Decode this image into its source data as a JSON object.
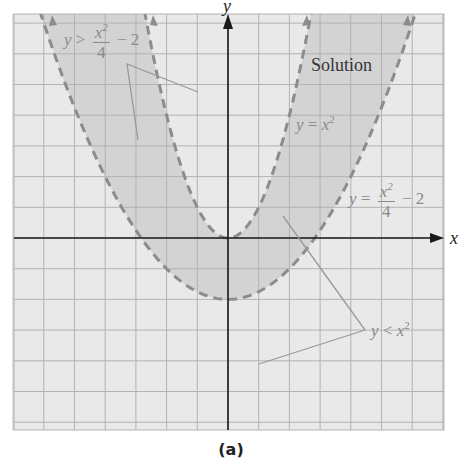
{
  "figure": {
    "caption": "(a)",
    "axis_labels": {
      "x": "x",
      "y": "y"
    },
    "region_label": "Solution",
    "annotations": {
      "inequality_upper": {
        "lhs": "y",
        "op": ">",
        "num": "x",
        "num_exp": "2",
        "den": "4",
        "tail": "− 2"
      },
      "curve_inner": {
        "lhs": "y",
        "op": "=",
        "base": "x",
        "exp": "2"
      },
      "curve_outer": {
        "lhs": "y",
        "op": "=",
        "num": "x",
        "num_exp": "2",
        "den": "4",
        "tail": "− 2"
      },
      "inequality_lower": {
        "lhs": "y",
        "op": "<",
        "base": "x",
        "exp": "2"
      }
    }
  },
  "colors": {
    "background": "#e9e9e9",
    "solution_fill": "#d3d3d3",
    "grid": "#b3b3b3",
    "axis": "#1a1a1a",
    "curve": "#8c8c8c",
    "leader": "#9a9a9a",
    "label": "#8a8a8a"
  },
  "chart_data": {
    "type": "area",
    "title": "",
    "xlabel": "x",
    "ylabel": "y",
    "xlim": [
      -7,
      7
    ],
    "ylim": [
      -6.2,
      7.3
    ],
    "grid": true,
    "grid_step": 1,
    "legend": "none",
    "series": [
      {
        "name": "y = x^2",
        "equation": "y = x^2",
        "style": "dashed",
        "role": "boundary (not included)"
      },
      {
        "name": "y = x^2/4 - 2",
        "equation": "y = x^2/4 - 2",
        "style": "dashed",
        "role": "boundary (not included)"
      }
    ],
    "shaded_region": {
      "label": "Solution",
      "conditions": [
        "y > x^2/4 - 2",
        "y < x^2"
      ],
      "description": "Region between the two parabolas: above y = x^2/4 - 2 and below y = x^2"
    },
    "key_points": [
      {
        "label": "vertex of y = x^2",
        "x": 0,
        "y": 0
      },
      {
        "label": "vertex of y = x^2/4 - 2",
        "x": 0,
        "y": -2
      },
      {
        "label": "intersection",
        "x": -1.63,
        "y": -1.33
      },
      {
        "label": "intersection",
        "x": 1.63,
        "y": -1.33
      }
    ],
    "annotations": [
      "y > x^2/4 - 2",
      "y = x^2",
      "y = x^2/4 - 2",
      "y < x^2",
      "Solution"
    ]
  }
}
